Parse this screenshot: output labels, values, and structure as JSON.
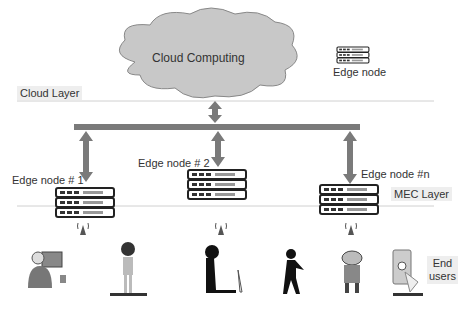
{
  "cloud": {
    "label": "Cloud Computing"
  },
  "legend": {
    "edge_node_label": "Edge node"
  },
  "layers": {
    "cloud": "Cloud Layer",
    "mec": "MEC Layer"
  },
  "nodes": [
    {
      "label": "Edge node # 1"
    },
    {
      "label": "Edge node # 2"
    },
    {
      "label": "Edge node #n"
    }
  ],
  "end_users": {
    "label_line1": "End",
    "label_line2": "users"
  },
  "colors": {
    "cloud_fill": "#c8c8c8",
    "arrow": "#7a7a7a",
    "bar": "#7a7a7a",
    "line": "#cfcfcf"
  }
}
